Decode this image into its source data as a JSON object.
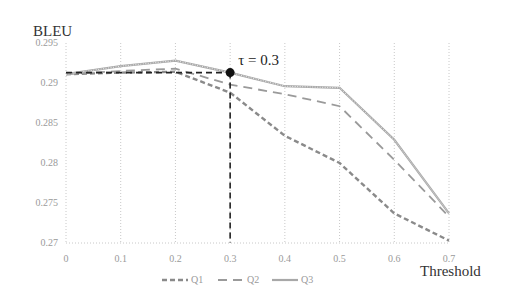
{
  "chart_data": {
    "type": "line",
    "title": "",
    "xlabel": "Threshold",
    "ylabel": "BLEU",
    "x": [
      0,
      0.1,
      0.2,
      0.3,
      0.4,
      0.5,
      0.6,
      0.7
    ],
    "x_tick_labels": [
      "0",
      "0.1",
      "0.2",
      "0.3",
      "0.4",
      "0.5",
      "0.6",
      "0.7"
    ],
    "y_tick_labels": [
      "0.295",
      "0.29",
      "0.285",
      "0.28",
      "0.275",
      "0.27"
    ],
    "y_ticks": [
      0.295,
      0.29,
      0.285,
      0.28,
      0.275,
      0.27
    ],
    "ylim": [
      0.27,
      0.295
    ],
    "xlim": [
      0,
      0.7
    ],
    "grid": "vertical dotted",
    "legend_position": "bottom",
    "series": [
      {
        "name": "Q1",
        "style": "dashed-wavy",
        "color": "#8a8a8a",
        "values": [
          0.2911,
          0.2913,
          0.2914,
          0.2888,
          0.2834,
          0.28,
          0.2737,
          0.2703
        ]
      },
      {
        "name": "Q2",
        "style": "long-dash",
        "color": "#9a9a9a",
        "values": [
          0.2911,
          0.2915,
          0.2918,
          0.2898,
          0.2886,
          0.2871,
          0.2804,
          0.2733
        ]
      },
      {
        "name": "Q3",
        "style": "solid-wavy",
        "color": "#a0a0a0",
        "values": [
          0.2911,
          0.2921,
          0.2928,
          0.2913,
          0.2896,
          0.2894,
          0.2829,
          0.2737
        ]
      }
    ],
    "annotations": [
      {
        "text": "τ = 0.3",
        "x": 0.3,
        "y": 0.2913,
        "marker": "filled-circle",
        "guide_lines": "dashed horizontal to y-axis at 0.2913 and vertical to x-axis at 0.3"
      }
    ]
  },
  "labels": {
    "ylabel": "BLEU",
    "xlabel": "Threshold",
    "annotation": "τ = 0.3",
    "legend": [
      "Q1",
      "Q2",
      "Q3"
    ]
  }
}
